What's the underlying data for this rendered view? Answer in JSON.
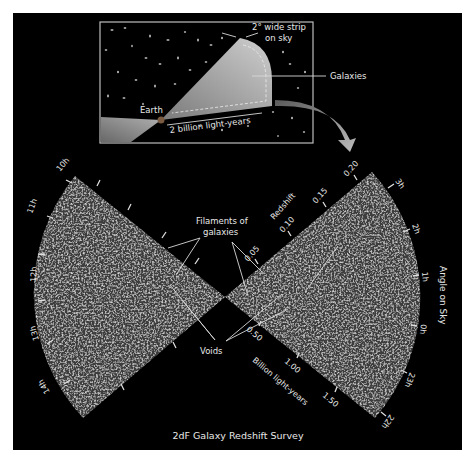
{
  "colors": {
    "page_background": "#ffffff",
    "panel_background": "#000000",
    "wedge_fill": "#3a3a3a",
    "text": "#e8e8e8",
    "inset_border": "#bdbdbd",
    "inset_beam": "#c8c8c8",
    "arrow": "#9a9a9a"
  },
  "inset": {
    "strip_label_line1": "2° wide strip",
    "strip_label_line2": "on sky",
    "galaxies_label": "Galaxies",
    "earth_label": "Earth",
    "distance_label": "2 billion light-years"
  },
  "main": {
    "caption": "2dF Galaxy Redshift Survey",
    "filaments_label_line1": "Filaments of",
    "filaments_label_line2": "galaxies",
    "voids_label": "Voids",
    "redshift_axis": {
      "title": "Redshift",
      "ticks": [
        "0.05",
        "0.10",
        "0.15",
        "0.20"
      ]
    },
    "distance_axis": {
      "title": "Billion light-years",
      "ticks": [
        "0.50",
        "1.00",
        "1.50"
      ]
    },
    "angle_axis": {
      "title": "Angle on Sky",
      "right_ticks": [
        "3h",
        "2h",
        "1h",
        "0h",
        "23h",
        "22h"
      ],
      "left_ticks": [
        "10h",
        "11h",
        "12h",
        "13h",
        "14h"
      ]
    }
  }
}
